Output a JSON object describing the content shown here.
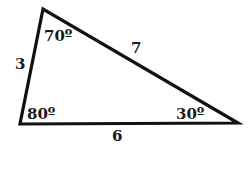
{
  "diagram": {
    "type": "triangle",
    "stroke_color": "#111111",
    "label_color": "#1a1a1a",
    "vertices": {
      "top": {
        "x": 43,
        "y": 9,
        "angle_label": "70º"
      },
      "bottom_left": {
        "x": 20,
        "y": 124,
        "angle_label": "80º"
      },
      "bottom_right": {
        "x": 238,
        "y": 123,
        "angle_label": "30º"
      }
    },
    "sides": {
      "left": {
        "label": "3"
      },
      "hypotenuse": {
        "label": "7"
      },
      "bottom": {
        "label": "6"
      }
    }
  }
}
